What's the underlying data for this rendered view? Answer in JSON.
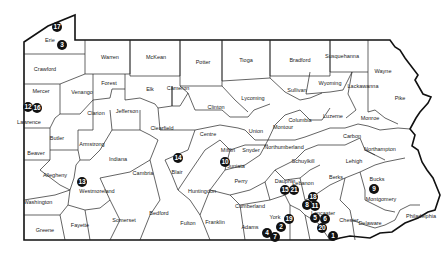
{
  "map": {
    "region": "Pennsylvania",
    "counties": [
      {
        "name": "Erie",
        "x": 50,
        "y": 40
      },
      {
        "name": "Warren",
        "x": 110,
        "y": 57
      },
      {
        "name": "McKean",
        "x": 156,
        "y": 57
      },
      {
        "name": "Potter",
        "x": 203,
        "y": 62
      },
      {
        "name": "Tioga",
        "x": 246,
        "y": 60
      },
      {
        "name": "Bradford",
        "x": 300,
        "y": 60
      },
      {
        "name": "Susquehanna",
        "x": 342,
        "y": 56
      },
      {
        "name": "Wayne",
        "x": 383,
        "y": 71
      },
      {
        "name": "Crawford",
        "x": 45,
        "y": 69
      },
      {
        "name": "Forest",
        "x": 109,
        "y": 83
      },
      {
        "name": "Elk",
        "x": 150,
        "y": 89
      },
      {
        "name": "Cameron",
        "x": 178,
        "y": 88
      },
      {
        "name": "Clinton",
        "x": 216,
        "y": 107
      },
      {
        "name": "Lycoming",
        "x": 253,
        "y": 98
      },
      {
        "name": "Sullivan",
        "x": 297,
        "y": 90
      },
      {
        "name": "Wyoming",
        "x": 330,
        "y": 83
      },
      {
        "name": "Lackawanna",
        "x": 363,
        "y": 86
      },
      {
        "name": "Pike",
        "x": 400,
        "y": 98
      },
      {
        "name": "Mercer",
        "x": 41,
        "y": 91
      },
      {
        "name": "Venango",
        "x": 82,
        "y": 92
      },
      {
        "name": "Clarion",
        "x": 96,
        "y": 113
      },
      {
        "name": "Jefferson",
        "x": 127,
        "y": 111
      },
      {
        "name": "Clearfield",
        "x": 162,
        "y": 128
      },
      {
        "name": "Centre",
        "x": 208,
        "y": 134
      },
      {
        "name": "Union",
        "x": 256,
        "y": 131
      },
      {
        "name": "Montour",
        "x": 283,
        "y": 127
      },
      {
        "name": "Columbia",
        "x": 300,
        "y": 120
      },
      {
        "name": "Luzerne",
        "x": 333,
        "y": 116
      },
      {
        "name": "Monroe",
        "x": 370,
        "y": 118
      },
      {
        "name": "Lawrence",
        "x": 29,
        "y": 122
      },
      {
        "name": "Butler",
        "x": 57,
        "y": 138
      },
      {
        "name": "Armstrong",
        "x": 92,
        "y": 144
      },
      {
        "name": "Carbon",
        "x": 352,
        "y": 136
      },
      {
        "name": "Beaver",
        "x": 36,
        "y": 153
      },
      {
        "name": "Indiana",
        "x": 118,
        "y": 159
      },
      {
        "name": "Mifflin",
        "x": 228,
        "y": 150
      },
      {
        "name": "Snyder",
        "x": 251,
        "y": 150
      },
      {
        "name": "Northumberland",
        "x": 284,
        "y": 147
      },
      {
        "name": "Schuylkill",
        "x": 303,
        "y": 161
      },
      {
        "name": "Northampton",
        "x": 380,
        "y": 149
      },
      {
        "name": "Lehigh",
        "x": 354,
        "y": 161
      },
      {
        "name": "Allegheny",
        "x": 55,
        "y": 175
      },
      {
        "name": "Cambria",
        "x": 143,
        "y": 173
      },
      {
        "name": "Blair",
        "x": 177,
        "y": 172
      },
      {
        "name": "Juniata",
        "x": 236,
        "y": 166
      },
      {
        "name": "Perry",
        "x": 241,
        "y": 181
      },
      {
        "name": "Westmoreland",
        "x": 97,
        "y": 191
      },
      {
        "name": "Dauphin",
        "x": 285,
        "y": 181
      },
      {
        "name": "Lebanon",
        "x": 303,
        "y": 183
      },
      {
        "name": "Berks",
        "x": 336,
        "y": 177
      },
      {
        "name": "Bucks",
        "x": 377,
        "y": 179
      },
      {
        "name": "Huntingdon",
        "x": 202,
        "y": 191
      },
      {
        "name": "Montgomery",
        "x": 381,
        "y": 199
      },
      {
        "name": "Washington",
        "x": 38,
        "y": 202
      },
      {
        "name": "Cumberland",
        "x": 250,
        "y": 206
      },
      {
        "name": "Bedford",
        "x": 159,
        "y": 213
      },
      {
        "name": "Somerset",
        "x": 124,
        "y": 220
      },
      {
        "name": "Fulton",
        "x": 188,
        "y": 223
      },
      {
        "name": "Franklin",
        "x": 215,
        "y": 222
      },
      {
        "name": "York",
        "x": 275,
        "y": 217
      },
      {
        "name": "Lancaster",
        "x": 323,
        "y": 213
      },
      {
        "name": "Adams",
        "x": 250,
        "y": 227
      },
      {
        "name": "Chester",
        "x": 349,
        "y": 220
      },
      {
        "name": "Philadelphia",
        "x": 421,
        "y": 216
      },
      {
        "name": "Delaware",
        "x": 370,
        "y": 223
      },
      {
        "name": "Fayette",
        "x": 80,
        "y": 225
      },
      {
        "name": "Greene",
        "x": 45,
        "y": 230
      }
    ],
    "markers": [
      {
        "label": "17",
        "x": 57,
        "y": 27
      },
      {
        "label": "3",
        "x": 62,
        "y": 45
      },
      {
        "label": "12",
        "x": 28,
        "y": 107
      },
      {
        "label": "16",
        "x": 37,
        "y": 108
      },
      {
        "label": "13",
        "x": 82,
        "y": 182
      },
      {
        "label": "14",
        "x": 178,
        "y": 158
      },
      {
        "label": "10",
        "x": 225,
        "y": 162
      },
      {
        "label": "15",
        "x": 285,
        "y": 190
      },
      {
        "label": "21",
        "x": 294,
        "y": 190
      },
      {
        "label": "18",
        "x": 313,
        "y": 197
      },
      {
        "label": "8",
        "x": 307,
        "y": 205
      },
      {
        "label": "11",
        "x": 315,
        "y": 206
      },
      {
        "label": "19",
        "x": 289,
        "y": 219
      },
      {
        "label": "2",
        "x": 281,
        "y": 227
      },
      {
        "label": "4",
        "x": 267,
        "y": 233
      },
      {
        "label": "7",
        "x": 275,
        "y": 237
      },
      {
        "label": "5",
        "x": 315,
        "y": 218
      },
      {
        "label": "6",
        "x": 325,
        "y": 219
      },
      {
        "label": "20",
        "x": 322,
        "y": 228
      },
      {
        "label": "1",
        "x": 333,
        "y": 236
      },
      {
        "label": "9",
        "x": 374,
        "y": 189
      }
    ]
  }
}
